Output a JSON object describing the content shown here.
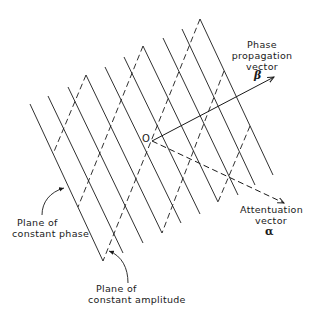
{
  "colors": {
    "ink": "#1a1a1a",
    "background": "#ffffff"
  },
  "origin": {
    "label": "O",
    "x": 152,
    "y": 141
  },
  "phase_vector": {
    "lines": [
      "Phase",
      "propagation",
      "vector"
    ],
    "symbol": "β",
    "tip": {
      "x": 274,
      "y": 77
    }
  },
  "attenuation_vector": {
    "lines": [
      "Attentuation",
      "vector"
    ],
    "symbol": "α",
    "tip": {
      "x": 284,
      "y": 203
    }
  },
  "constant_phase_label": {
    "lines": [
      "Plane of",
      "constant phase"
    ]
  },
  "constant_amplitude_label": {
    "lines": [
      "Plane of",
      "constant amplitude"
    ]
  },
  "planes": {
    "constant_phase_solid": [
      [
        30,
        104,
        103,
        261
      ],
      [
        48,
        96,
        123,
        253
      ],
      [
        68,
        87,
        143,
        243
      ],
      [
        86,
        75,
        162,
        233
      ],
      [
        105,
        67,
        181,
        223
      ],
      [
        124,
        57,
        200,
        214
      ],
      [
        143,
        46,
        218,
        202
      ],
      [
        163,
        38,
        238,
        195
      ],
      [
        182,
        29,
        255,
        185
      ],
      [
        200,
        19,
        273,
        175
      ]
    ],
    "constant_amplitude_dashed": [
      [
        86,
        75,
        53,
        154
      ],
      [
        143,
        46,
        78,
        207
      ],
      [
        200,
        19,
        103,
        261
      ],
      [
        224,
        71,
        162,
        233
      ],
      [
        250,
        126,
        218,
        202
      ]
    ]
  }
}
